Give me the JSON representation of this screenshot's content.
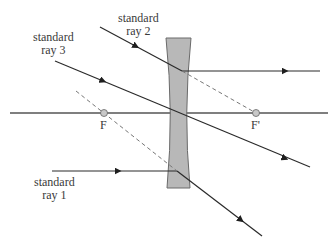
{
  "diagram": {
    "type": "ray-diagram-diverging-lens",
    "labels": {
      "ray1": [
        "standard",
        "ray 1"
      ],
      "ray2": [
        "standard",
        "ray 2"
      ],
      "ray3": [
        "standard",
        "ray 3"
      ],
      "focal_left": "F",
      "focal_right": "F'"
    },
    "colors": {
      "ray": "#2a2a2a",
      "axis": "#555555",
      "lens_fill": "#b8b8b8",
      "lens_stroke": "#6a6a6a",
      "dashed": "#777777",
      "focal_point_fill": "#c8c8c8",
      "text": "#3a3a3a"
    }
  }
}
